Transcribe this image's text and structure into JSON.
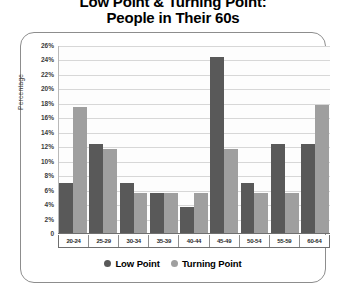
{
  "title": {
    "line1": "Low Point & Turning Point:",
    "line2": "People in Their 60s"
  },
  "colors": {
    "low_point": "#595959",
    "turning_point": "#9f9f9f",
    "gridline": "#d7d7d7",
    "axis": "#6f6f6f",
    "frame": "#8d8d8d",
    "text": "#000000"
  },
  "axis": {
    "y_title": "Percentage",
    "y_ticks": [
      "26%",
      "24%",
      "22%",
      "20%",
      "18%",
      "16%",
      "14%",
      "12%",
      "10%",
      "8%",
      "6%",
      "4%",
      "2%",
      "0"
    ]
  },
  "legend": {
    "position": "bottom-center",
    "items": [
      {
        "label": "Low Point",
        "marker": "circle-icon",
        "color": "#595959"
      },
      {
        "label": "Turning Point",
        "marker": "circle-icon",
        "color": "#9f9f9f"
      }
    ]
  },
  "chart_data": {
    "type": "bar",
    "title": "Low Point & Turning Point: People in Their 60s",
    "xlabel": "",
    "ylabel": "Percentage",
    "ylim": [
      0,
      26
    ],
    "ytick_step": 2,
    "grid": true,
    "categories": [
      "20-24",
      "25-29",
      "30-34",
      "35-39",
      "40-44",
      "45-49",
      "50-54",
      "55-59",
      "60-64"
    ],
    "series": [
      {
        "name": "Low Point",
        "color": "#595959",
        "values": [
          7.0,
          12.5,
          7.0,
          5.7,
          3.8,
          24.5,
          7.0,
          12.5,
          12.5
        ]
      },
      {
        "name": "Turning Point",
        "color": "#9f9f9f",
        "values": [
          17.5,
          11.7,
          5.7,
          5.7,
          5.7,
          11.7,
          5.7,
          5.7,
          17.8
        ]
      }
    ]
  }
}
